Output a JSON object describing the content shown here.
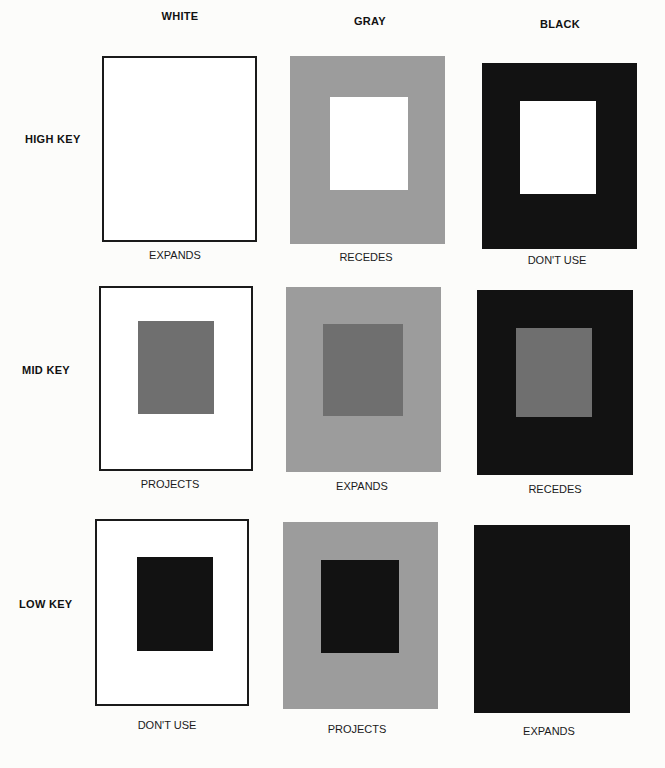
{
  "columns": [
    {
      "label": "WHITE",
      "x": 180,
      "y": 10
    },
    {
      "label": "GRAY",
      "x": 370,
      "y": 15
    },
    {
      "label": "BLACK",
      "x": 560,
      "y": 18
    }
  ],
  "rows": [
    {
      "label": "HIGH KEY",
      "x": 25,
      "y": 133
    },
    {
      "label": "MID KEY",
      "x": 22,
      "y": 364
    },
    {
      "label": "LOW KEY",
      "x": 19,
      "y": 598
    }
  ],
  "colors": {
    "white": "#ffffff",
    "gray": "#9c9c9c",
    "mid_gray": "#6f6f6f",
    "black": "#121212"
  },
  "panels": [
    {
      "row": "HIGH KEY",
      "column": "WHITE",
      "bg": "white",
      "x": 102,
      "y": 56,
      "w": 155,
      "h": 186,
      "inner": null,
      "caption": "EXPANDS",
      "cx": 175,
      "cy": 249
    },
    {
      "row": "HIGH KEY",
      "column": "GRAY",
      "bg": "gray",
      "x": 290,
      "y": 56,
      "w": 155,
      "h": 188,
      "inner": {
        "color": "#ffffff",
        "x": 40,
        "y": 41,
        "w": 78,
        "h": 93
      },
      "caption": "RECEDES",
      "cx": 366,
      "cy": 251
    },
    {
      "row": "HIGH KEY",
      "column": "BLACK",
      "bg": "black",
      "x": 482,
      "y": 63,
      "w": 155,
      "h": 186,
      "inner": {
        "color": "#ffffff",
        "x": 38,
        "y": 38,
        "w": 76,
        "h": 93
      },
      "caption": "DON'T USE",
      "cx": 557,
      "cy": 254
    },
    {
      "row": "MID KEY",
      "column": "WHITE",
      "bg": "white",
      "x": 99,
      "y": 286,
      "w": 154,
      "h": 185,
      "inner": {
        "color": "#6f6f6f",
        "x": 37,
        "y": 33,
        "w": 76,
        "h": 93
      },
      "caption": "PROJECTS",
      "cx": 170,
      "cy": 478
    },
    {
      "row": "MID KEY",
      "column": "GRAY",
      "bg": "gray",
      "x": 286,
      "y": 287,
      "w": 155,
      "h": 185,
      "inner": {
        "color": "#6f6f6f",
        "x": 37,
        "y": 37,
        "w": 80,
        "h": 92
      },
      "caption": "EXPANDS",
      "cx": 362,
      "cy": 480
    },
    {
      "row": "MID KEY",
      "column": "BLACK",
      "bg": "black",
      "x": 477,
      "y": 290,
      "w": 156,
      "h": 185,
      "inner": {
        "color": "#6f6f6f",
        "x": 39,
        "y": 38,
        "w": 76,
        "h": 89
      },
      "caption": "RECEDES",
      "cx": 555,
      "cy": 483
    },
    {
      "row": "LOW KEY",
      "column": "WHITE",
      "bg": "white",
      "x": 95,
      "y": 519,
      "w": 154,
      "h": 187,
      "inner": {
        "color": "#121212",
        "x": 40,
        "y": 36,
        "w": 76,
        "h": 94
      },
      "caption": "DON'T USE",
      "cx": 167,
      "cy": 719
    },
    {
      "row": "LOW KEY",
      "column": "GRAY",
      "bg": "gray",
      "x": 283,
      "y": 522,
      "w": 155,
      "h": 187,
      "inner": {
        "color": "#121212",
        "x": 38,
        "y": 38,
        "w": 78,
        "h": 93
      },
      "caption": "PROJECTS",
      "cx": 357,
      "cy": 723
    },
    {
      "row": "LOW KEY",
      "column": "BLACK",
      "bg": "black",
      "x": 474,
      "y": 525,
      "w": 156,
      "h": 188,
      "inner": null,
      "caption": "EXPANDS",
      "cx": 549,
      "cy": 725
    }
  ]
}
